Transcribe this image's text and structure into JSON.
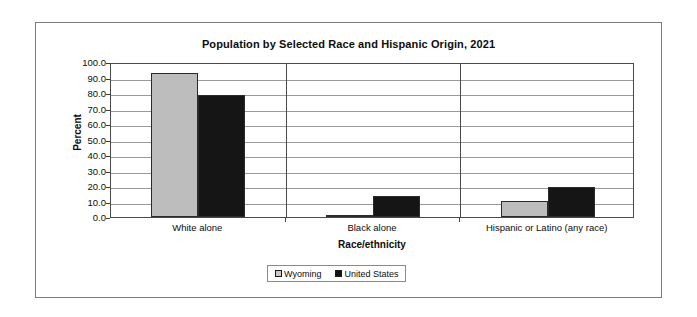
{
  "chart_data": {
    "type": "bar",
    "title": "Population by Selected Race and Hispanic Origin, 2021",
    "xlabel": "Race/ethnicity",
    "ylabel": "Percent",
    "categories": [
      "White alone",
      "Black alone",
      "Hispanic or Latino (any race)"
    ],
    "series": [
      {
        "name": "Wyoming",
        "color": "#bdbdbd",
        "values": [
          92.8,
          1.3,
          10.5
        ]
      },
      {
        "name": "United States",
        "color": "#151515",
        "values": [
          78.5,
          13.6,
          19.5
        ]
      }
    ],
    "ylim": [
      0,
      100
    ],
    "ytick_labels": [
      "100.0",
      "90.0",
      "80.0",
      "70.0",
      "60.0",
      "50.0",
      "40.0",
      "30.0",
      "20.0",
      "10.0",
      "0.0"
    ],
    "ytick_values": [
      100,
      90,
      80,
      70,
      60,
      50,
      40,
      30,
      20,
      10,
      0
    ],
    "grid": true,
    "legend_position": "bottom"
  },
  "legend": {
    "items": [
      {
        "label": "Wyoming",
        "marker": "square-light-gray"
      },
      {
        "label": "United States",
        "marker": "square-black"
      }
    ]
  }
}
